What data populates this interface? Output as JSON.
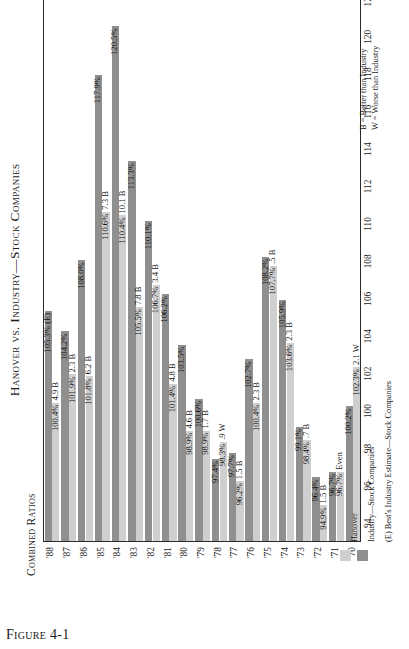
{
  "figure": {
    "caption_prefix": "Figure",
    "caption_number": "4-1"
  },
  "chart_data": {
    "type": "bar",
    "orientation": "horizontal-rotated",
    "title": "Hanover vs. Industry—Stock Companies",
    "xlabel": "Combined Ratios",
    "ylabel": "",
    "xlim": [
      93,
      122.5
    ],
    "grid": false,
    "legend_position": "right",
    "categories": [
      "'70",
      "'71",
      "'72",
      "'73",
      "'74",
      "'75",
      "'76",
      "'77",
      "'78",
      "'79",
      "'80",
      "'81",
      "'82",
      "'83",
      "'84",
      "'85",
      "'86",
      "'87",
      "'88"
    ],
    "tick_labels": [
      "94",
      "96",
      "98",
      "100",
      "102",
      "104",
      "106",
      "108",
      "110",
      "112",
      "114",
      "116",
      "118",
      "120",
      "122"
    ],
    "tick_values": [
      94,
      96,
      98,
      100,
      102,
      104,
      106,
      108,
      110,
      112,
      114,
      116,
      118,
      120,
      122
    ],
    "series": [
      {
        "name": "Hanover",
        "color": "#cfcfcf",
        "values": [
          102.3,
          96.7,
          94.9,
          98.4,
          103.6,
          107.7,
          100.4,
          96.2,
          98.3,
          98.9,
          98.9,
          101.4,
          106.7,
          105.5,
          110.4,
          110.6,
          101.8,
          101.9,
          100.4
        ],
        "value_labels": [
          "102.3%",
          "96.7%",
          "94.9%",
          "98.4%",
          "103.6%",
          "107.7%",
          "100.4%",
          "96.2%",
          "98.3%",
          "98.9%",
          "98.9%",
          "101.4%",
          "106.7%",
          "105.5%",
          "110.4%",
          "110.6%",
          "101.8%",
          "101.9%",
          "100.4%"
        ],
        "delta_labels": [
          "2.1 W",
          "Even",
          "1.5 B",
          ".7 B",
          "2.3 B",
          ".5 B",
          "2.3 B",
          "1.5 B",
          ".9 W",
          "1.7 B",
          "4.6 B",
          "4.8 B",
          "3.4 B",
          "7.8 B",
          "10.1 B",
          "7.3 B",
          "6.2 B",
          "2.3 B",
          "4.9 B"
        ]
      },
      {
        "name": "Industry—Stock Companies",
        "color": "#8f8f8f",
        "values": [
          100.2,
          96.7,
          96.4,
          99.1,
          105.9,
          108.2,
          102.7,
          97.7,
          97.4,
          100.6,
          103.5,
          106.2,
          110.1,
          113.3,
          120.5,
          117.9,
          108.0,
          104.2,
          105.3
        ],
        "value_labels": [
          "100.2%",
          "96.7%",
          "96.4%",
          "99.1%",
          "105.9%",
          "108.2%",
          "102.7%",
          "97.7%",
          "97.4%",
          "100.6%",
          "103.5%",
          "106.2%",
          "110.1%",
          "113.3%",
          "120.5%",
          "117.9%",
          "108.0%",
          "104.2%",
          "105.3% (E)"
        ],
        "delta_labels": [
          "",
          "",
          "",
          "",
          "",
          "",
          "",
          "",
          "",
          "",
          "",
          "",
          "",
          "",
          "",
          "",
          "",
          "",
          ""
        ]
      }
    ],
    "annotations": [
      "B = Better than Industry",
      "W = Worse than Industry"
    ],
    "legend_entries": [
      {
        "label": "Hanover",
        "color": "#cfcfcf"
      },
      {
        "label": "Industry—Stock Companies",
        "color": "#8f8f8f"
      },
      {
        "label": "(E) Best's Industry Estimate—Stock Companies",
        "color": ""
      }
    ]
  }
}
